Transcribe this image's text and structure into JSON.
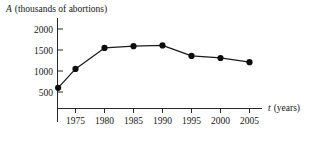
{
  "chart_data": {
    "type": "line",
    "title": "",
    "ylabel_var": "A",
    "ylabel_units": "(thousands of abortions)",
    "ylabel": "A (thousands of abortions)",
    "xlabel_var": "t",
    "xlabel_units": "(years)",
    "xlabel": "t (years)",
    "x": [
      1972,
      1975,
      1980,
      1985,
      1990,
      1995,
      2000,
      2005
    ],
    "values": [
      600,
      1050,
      1550,
      1590,
      1610,
      1360,
      1310,
      1210
    ],
    "xticks": [
      1975,
      1980,
      1985,
      1990,
      1995,
      2000,
      2005
    ],
    "xtick_labels": [
      "1975",
      "1980",
      "1985",
      "1990",
      "1995",
      "2000",
      "2005"
    ],
    "yticks": [
      500,
      1000,
      1500,
      2000
    ],
    "ytick_labels": [
      "500",
      "1000",
      "1500",
      "2000"
    ],
    "xlim": [
      1971.5,
      2007.5
    ],
    "ylim": [
      0,
      2150
    ],
    "grid": false,
    "legend": false,
    "marker": "filled-circle",
    "line_color": "#1a1a1a",
    "marker_color": "#0c0c0c",
    "axis_color": "#111111"
  }
}
